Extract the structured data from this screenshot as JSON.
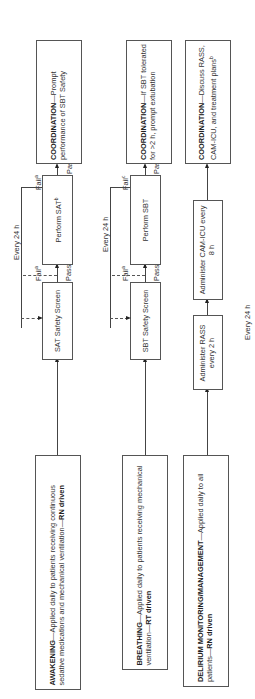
{
  "rows": {
    "awakening": {
      "main": {
        "title": "AWAKENING",
        "text": "—Applied daily to patients receiving continuous sedative medications and mechanical ventilation—",
        "driver": "RN driven"
      },
      "screen": "SAT Safety Screen",
      "perform": "Perform SAT",
      "perform_sup": "b",
      "fail1": "Fail",
      "fail1_sup": "a",
      "fail2": "Fail",
      "fail2_sup": "a",
      "pass1": "Pass",
      "pass2": "Pass",
      "pass2_sup": "b",
      "coord": {
        "title": "COORDINATION",
        "text": "—Prompt performance of SBT Safety"
      },
      "cycle": "Every 24 h"
    },
    "breathing": {
      "main": {
        "title": "BREATHING",
        "text": "—Applied daily to patients receiving mechanical ventilation—",
        "driver": "RT driven"
      },
      "screen": "SBT Safety Screen",
      "perform": "Perform SBT",
      "fail1": "Fail",
      "fail1_sup": "a",
      "fail2": "Fail",
      "fail2_sup": "c",
      "pass1": "Pass",
      "pass2": "Pass",
      "coord": {
        "title": "COORDINATION",
        "text": "—If SBT tolerated for >2 h, prompt extubation"
      },
      "cycle": "Every 24 h"
    },
    "delirium": {
      "main": {
        "title": "DELIRIUM MONITORING/MANAGEMENT",
        "text": "—Applied daily to all patients—",
        "driver": "RN driven"
      },
      "step1": "Administer RASS every 2 h",
      "step2": "Administer CAM-ICU every 8 h",
      "coord": {
        "title": "COORDINATION",
        "text": "—Discuss RASS, CAM-ICU, and treatment plans",
        "sup": "b"
      },
      "cycle": "Every 24 h"
    }
  }
}
